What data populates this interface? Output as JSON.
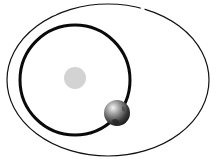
{
  "diagram": {
    "type": "orbital-diagram",
    "background": "#ffffff",
    "outer_orbit": {
      "shape": "ellipse",
      "cx": 108,
      "cy": 80,
      "rx": 101,
      "ry": 76,
      "stroke": "#111111",
      "stroke_width": 1.2,
      "gaps_near_top": 2
    },
    "inner_orbit": {
      "shape": "circle",
      "cx": 75,
      "cy": 80,
      "r": 55,
      "stroke": "#0a0a0a",
      "stroke_width": 3
    },
    "central_body": {
      "shape": "circle",
      "cx": 75,
      "cy": 78,
      "r": 11,
      "fill": "#d3d3d3"
    },
    "planet": {
      "shape": "sphere",
      "cx": 117,
      "cy": 113,
      "r": 13,
      "colors": [
        "#f2f2f2",
        "#8a8a8a",
        "#2a2a2a"
      ]
    }
  }
}
